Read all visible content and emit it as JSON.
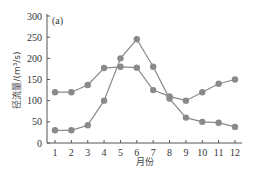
{
  "chart_data": {
    "type": "line",
    "title": "",
    "panel_label": "(a)",
    "xlabel": "月份",
    "ylabel": "径流量/(m³/s)",
    "x": [
      1,
      2,
      3,
      4,
      5,
      6,
      7,
      8,
      9,
      10,
      11,
      12
    ],
    "ylim": [
      0,
      300
    ],
    "yticks": [
      0,
      50,
      100,
      150,
      200,
      250,
      300
    ],
    "grid": false,
    "legend": "none",
    "series": [
      {
        "name": "series-1",
        "values": [
          30,
          30,
          42,
          100,
          200,
          245,
          180,
          105,
          60,
          50,
          48,
          38
        ],
        "color": "#8a8a8a"
      },
      {
        "name": "series-2",
        "values": [
          120,
          120,
          137,
          177,
          180,
          178,
          125,
          110,
          100,
          120,
          140,
          150
        ],
        "color": "#8a8a8a"
      }
    ]
  }
}
